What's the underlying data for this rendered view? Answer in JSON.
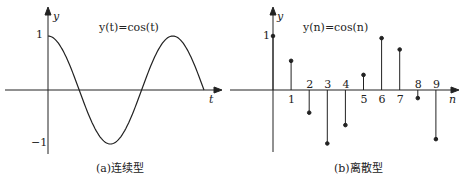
{
  "figure_a": {
    "formula": "y(t)=cos(t)",
    "y_label": "y",
    "x_label": "t",
    "tick_pos": "1",
    "tick_neg": "−1",
    "caption": "(a)连续型"
  },
  "figure_b": {
    "formula": "y(n)=cos(n)",
    "y_label": "y",
    "x_label": "n",
    "tick_pos": "1",
    "caption": "(b)离散型",
    "n_labels": [
      "1",
      "2",
      "3",
      "4",
      "5",
      "6",
      "7",
      "8",
      "9"
    ]
  },
  "chart_data": [
    {
      "type": "line",
      "title": "y(t)=cos(t)",
      "xlabel": "t",
      "ylabel": "y",
      "ylim": [
        -1,
        1
      ],
      "x": [
        0,
        1.57,
        3.14,
        4.71,
        6.28,
        7.85
      ],
      "values": [
        1,
        0,
        -1,
        0,
        1,
        0
      ]
    },
    {
      "type": "stem",
      "title": "y(n)=cos(n)",
      "xlabel": "n",
      "ylabel": "y",
      "categories": [
        0,
        1,
        2,
        3,
        4,
        5,
        6,
        7,
        8,
        9
      ],
      "values": [
        1,
        0.54,
        -0.42,
        -0.99,
        -0.65,
        0.28,
        0.96,
        0.75,
        -0.15,
        -0.91
      ]
    }
  ]
}
